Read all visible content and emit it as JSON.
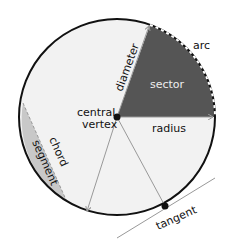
{
  "colors": {
    "circle_fill": "#f2f2f2",
    "circle_stroke": "#111111",
    "sector_fill": "#555555",
    "segment_fill": "#c8c8c8",
    "line_gray": "#999999",
    "text_dark": "#111111",
    "text_light": "#eeeeee"
  },
  "labels": {
    "arc": "arc",
    "sector": "sector",
    "diameter": "diameter",
    "central_vertex_line1": "central",
    "central_vertex_line2": "vertex",
    "radius": "radius",
    "chord": "chord",
    "segment": "segment",
    "tangent": "tangent"
  }
}
